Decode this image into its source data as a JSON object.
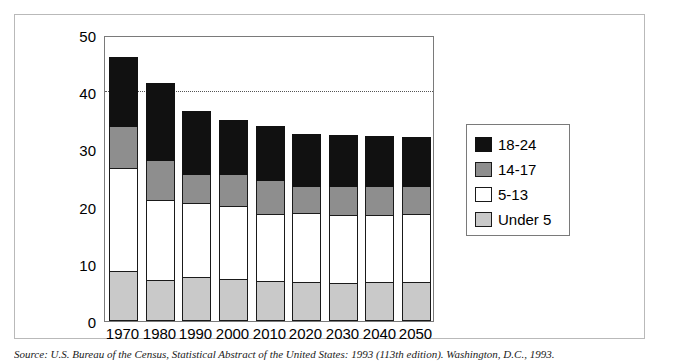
{
  "chart_data": {
    "type": "bar",
    "subtype": "stacked-vertical",
    "title": "",
    "xlabel": "",
    "ylabel": "",
    "ylim": [
      0,
      50
    ],
    "yticks": [
      0,
      10,
      20,
      30,
      40,
      50
    ],
    "grid": "dotted horizontal line at 40 only",
    "legend_position": "right",
    "categories": [
      "1970",
      "1980",
      "1990",
      "2000",
      "2010",
      "2020",
      "2030",
      "2040",
      "2050"
    ],
    "series": [
      {
        "name": "Under 5",
        "color": "#c9c9c9",
        "values": [
          8.6,
          7.0,
          7.6,
          7.1,
          6.8,
          6.7,
          6.5,
          6.6,
          6.7
        ]
      },
      {
        "name": "5-13",
        "color": "#ffffff",
        "values": [
          17.9,
          14.0,
          12.9,
          12.9,
          11.8,
          12.0,
          11.8,
          11.8,
          11.9
        ]
      },
      {
        "name": "14-17",
        "color": "#8e8e8e",
        "values": [
          7.5,
          7.0,
          5.0,
          5.5,
          5.9,
          4.8,
          5.2,
          5.1,
          4.9
        ]
      },
      {
        "name": "18-24",
        "color": "#111111",
        "values": [
          12.0,
          13.5,
          11.0,
          9.5,
          9.5,
          9.0,
          8.8,
          8.7,
          8.5
        ]
      }
    ],
    "totals": [
      46.0,
      41.5,
      36.5,
      35.0,
      34.0,
      32.5,
      32.3,
      32.2,
      32.0
    ]
  },
  "legend": {
    "items": [
      {
        "label": "18-24",
        "swatch": "black-swatch"
      },
      {
        "label": "14-17",
        "swatch": "dark-gray-swatch"
      },
      {
        "label": "5-13",
        "swatch": "white-swatch"
      },
      {
        "label": "Under 5",
        "swatch": "light-gray-swatch"
      }
    ]
  },
  "source": {
    "text": "Source:  U.S. Bureau of the Census, Statistical Abstract of the United States: 1993 (113th edition).  Washington, D.C., 1993."
  }
}
